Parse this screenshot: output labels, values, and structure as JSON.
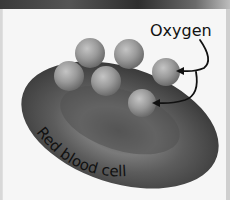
{
  "diagram": {
    "labels": {
      "oxygen": "Oxygen",
      "cell": "Red blood cell"
    },
    "colors": {
      "background": "#f6f6f6",
      "cell_dark": "#3c3c3c",
      "cell_mid": "#6a6a6a",
      "oxygen_light": "#b4b4b4",
      "oxygen_dark": "#6e6e6e",
      "arrow": "#111111"
    },
    "oxygen_count": 6
  }
}
